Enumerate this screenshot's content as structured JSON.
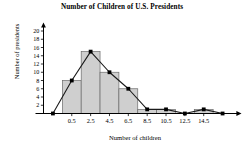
{
  "chart_data": {
    "type": "bar",
    "title": "Number of Children of U.S. Presidents",
    "xlabel": "Number of children",
    "ylabel": "Number of presidents",
    "categories": [
      "0.5",
      "2.5",
      "4.5",
      "6.5",
      "8.5",
      "10.5",
      "12.5",
      "14.5"
    ],
    "values": [
      8,
      15,
      10,
      6,
      1,
      1,
      0,
      1
    ],
    "series": [
      {
        "name": "Histogram",
        "values": [
          8,
          15,
          10,
          6,
          1,
          1,
          0,
          1
        ]
      },
      {
        "name": "Frequency polygon",
        "x": [
          "-1.5",
          "0.5",
          "2.5",
          "4.5",
          "6.5",
          "8.5",
          "10.5",
          "12.5",
          "14.5",
          "16.5"
        ],
        "values": [
          0,
          8,
          15,
          10,
          6,
          1,
          1,
          0,
          1,
          0
        ]
      }
    ],
    "xticks": [
      "0.5",
      "2.5",
      "4.5",
      "6.5",
      "8.5",
      "10.5",
      "12.5",
      "14.5"
    ],
    "yticks": [
      "2",
      "4",
      "6",
      "8",
      "10",
      "12",
      "14",
      "16",
      "18",
      "20"
    ],
    "ylim": [
      0,
      21
    ],
    "xlim": [
      -2.5,
      17.5
    ],
    "grid": false,
    "legend": "none",
    "bar_fill": "#cfcfcf",
    "bar_stroke": "#6b6b6b",
    "line_color": "#1a1a1a",
    "marker_color": "#000000",
    "axis_color": "#000000"
  }
}
